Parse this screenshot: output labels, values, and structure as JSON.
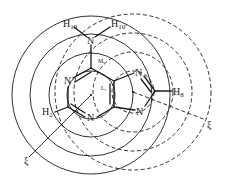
{
  "figure": {
    "line_color": "#1a1a1a",
    "background": "#ffffff"
  },
  "atoms": {
    "n_ring_upper_left": "N",
    "n_ring_bottom": "N",
    "n7": "N",
    "n9": "N",
    "n_amino": "N",
    "h10": {
      "base": "H",
      "sub": "10"
    },
    "h10p": {
      "base": "H",
      "sub": "10'"
    },
    "h8": {
      "base": "H",
      "sub": "8"
    },
    "h2": {
      "base": "H",
      "sub": "2"
    }
  },
  "ring_labels": {
    "m": "M,",
    "l": "L,"
  },
  "axis_labels": {
    "six_ring_axis": "ξ",
    "five_ring_axis": "ξ"
  },
  "contours": {
    "six_membered_ring": {
      "style": "solid",
      "count": 4
    },
    "five_membered_ring": {
      "style": "dashed",
      "count": 4
    }
  }
}
